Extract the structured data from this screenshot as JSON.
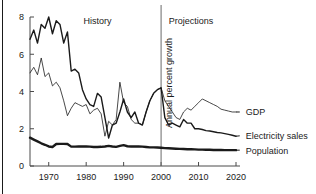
{
  "chart_data": {
    "type": "line",
    "title": "",
    "xlabel": "",
    "ylabel": "Annual percent growth",
    "xlim": [
      1965,
      2020
    ],
    "ylim": [
      0,
      8
    ],
    "grid": false,
    "legend_position": "right-inline",
    "x_ticks": [
      1970,
      1980,
      1990,
      2000,
      2010,
      2020
    ],
    "x_tick_labels": [
      "1970",
      "1980",
      "1990",
      "2000",
      "2010",
      "2020"
    ],
    "y_ticks": [
      0,
      2,
      4,
      6,
      8
    ],
    "y_tick_labels": [
      "0",
      "2",
      "4",
      "6",
      "8"
    ],
    "annotations": [
      {
        "text": "History",
        "x": 1983,
        "y": 7.6
      },
      {
        "text": "Projections",
        "x": 2008,
        "y": 7.6
      },
      {
        "text": "Annual percent growth",
        "x": 2000,
        "y": 4.4,
        "rotation": -90
      }
    ],
    "divider": {
      "x": 2000,
      "label": "history-projection-divider"
    },
    "series": [
      {
        "name": "Electricity sales",
        "label": "Electricity sales",
        "stroke_width": 1.4,
        "color": "#1a1a1a",
        "label_x": 2021,
        "label_y": 1.62,
        "x": [
          1965,
          1966,
          1967,
          1968,
          1969,
          1970,
          1971,
          1972,
          1973,
          1974,
          1975,
          1976,
          1977,
          1978,
          1979,
          1980,
          1981,
          1982,
          1983,
          1984,
          1985,
          1986,
          1987,
          1988,
          1989,
          1990,
          1991,
          1992,
          1993,
          1994,
          1995,
          1996,
          1997,
          1998,
          1999,
          2000,
          2001,
          2002,
          2003,
          2004,
          2005,
          2006,
          2007,
          2008,
          2009,
          2010,
          2011,
          2012,
          2013,
          2014,
          2015,
          2016,
          2017,
          2018,
          2019,
          2020
        ],
        "y": [
          6.8,
          7.3,
          6.6,
          7.6,
          7.4,
          8.0,
          7.1,
          7.8,
          7.6,
          6.6,
          7.2,
          5.1,
          5.2,
          5.0,
          4.1,
          3.6,
          3.3,
          3.2,
          3.9,
          3.7,
          2.6,
          1.5,
          2.2,
          2.3,
          2.9,
          3.6,
          2.9,
          2.6,
          2.9,
          2.3,
          2.2,
          2.9,
          3.5,
          3.9,
          4.1,
          4.2,
          2.6,
          2.2,
          2.3,
          2.2,
          2.1,
          2.5,
          2.3,
          2.3,
          2.0,
          2.0,
          1.96,
          1.9,
          1.88,
          1.84,
          1.8,
          1.78,
          1.74,
          1.7,
          1.65,
          1.6
        ]
      },
      {
        "name": "GDP",
        "label": "GDP",
        "stroke_width": 0.8,
        "color": "#1a1a1a",
        "label_x": 2021,
        "label_y": 2.9,
        "x": [
          1965,
          1966,
          1967,
          1968,
          1969,
          1970,
          1971,
          1972,
          1973,
          1974,
          1975,
          1976,
          1977,
          1978,
          1979,
          1980,
          1981,
          1982,
          1983,
          1984,
          1985,
          1986,
          1987,
          1988,
          1989,
          1990,
          1991,
          1992,
          1993,
          1994,
          1995,
          1996,
          1997,
          1998,
          1999,
          2000,
          2001,
          2002,
          2003,
          2004,
          2005,
          2006,
          2007,
          2008,
          2009,
          2010,
          2011,
          2012,
          2013,
          2014,
          2015,
          2016,
          2017,
          2018,
          2019,
          2020
        ],
        "y": [
          5.0,
          5.3,
          4.9,
          5.8,
          4.8,
          5.0,
          4.3,
          4.5,
          4.2,
          3.5,
          2.7,
          3.1,
          3.4,
          3.3,
          3.2,
          3.3,
          2.8,
          3.0,
          3.1,
          2.8,
          1.6,
          2.4,
          2.2,
          2.5,
          4.5,
          3.4,
          3.2,
          2.5,
          2.3,
          2.3,
          2.2,
          2.9,
          3.5,
          3.9,
          4.1,
          4.2,
          3.5,
          3.2,
          2.9,
          2.6,
          2.5,
          2.9,
          3.1,
          3.0,
          3.2,
          3.4,
          3.6,
          3.5,
          3.4,
          3.3,
          3.2,
          3.05,
          3.0,
          2.95,
          2.9,
          2.9
        ]
      },
      {
        "name": "Population",
        "label": "Population",
        "stroke_width": 2.4,
        "color": "#1a1a1a",
        "label_x": 2021,
        "label_y": 0.85,
        "x": [
          1965,
          1966,
          1967,
          1968,
          1969,
          1970,
          1971,
          1972,
          1973,
          1974,
          1975,
          1976,
          1977,
          1978,
          1979,
          1980,
          1981,
          1982,
          1983,
          1984,
          1985,
          1986,
          1987,
          1988,
          1989,
          1990,
          1991,
          1992,
          1993,
          1994,
          1995,
          1996,
          1997,
          1998,
          1999,
          2000,
          2001,
          2002,
          2003,
          2004,
          2005,
          2006,
          2007,
          2008,
          2009,
          2010,
          2011,
          2012,
          2013,
          2014,
          2015,
          2016,
          2017,
          2018,
          2019,
          2020
        ],
        "y": [
          1.52,
          1.42,
          1.32,
          1.22,
          1.14,
          1.05,
          1.02,
          1.18,
          1.19,
          1.19,
          1.18,
          1.04,
          1.04,
          1.05,
          1.05,
          1.05,
          1.04,
          1.02,
          1.02,
          1.03,
          1.05,
          1.08,
          1.05,
          1.03,
          1.08,
          1.12,
          1.06,
          1.05,
          1.05,
          1.05,
          1.04,
          1.02,
          1.0,
          1.0,
          0.99,
          0.98,
          0.96,
          0.95,
          0.94,
          0.93,
          0.92,
          0.91,
          0.9,
          0.9,
          0.89,
          0.88,
          0.88,
          0.87,
          0.87,
          0.86,
          0.86,
          0.86,
          0.85,
          0.85,
          0.85,
          0.85
        ]
      }
    ]
  }
}
